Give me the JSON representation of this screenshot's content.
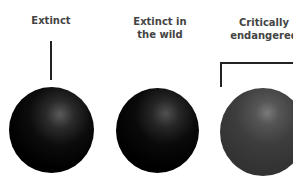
{
  "categories": [
    {
      "label": "Extinct",
      "tone": "#000000"
    },
    {
      "label": "Extinct in the wild",
      "tone": "#000000"
    },
    {
      "label": "Critically endangered",
      "tone": "#3a3a3a"
    }
  ],
  "labels": {
    "extinct": "Extinct",
    "extinct_wild_line1": "Extinct in",
    "extinct_wild_line2": "the wild",
    "critically_line1": "Critically",
    "critically_line2": "endangered"
  }
}
